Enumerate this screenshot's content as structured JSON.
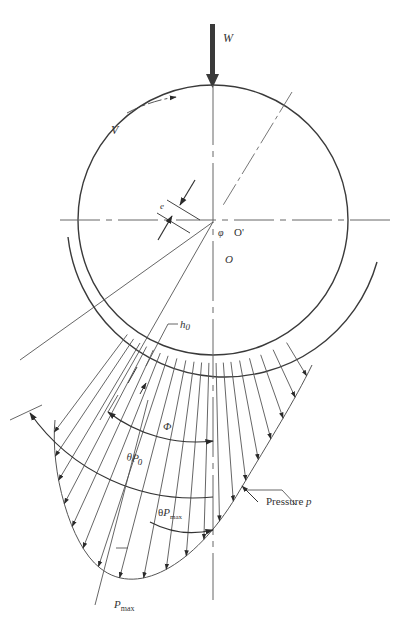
{
  "diagram": {
    "colors": {
      "line": "#3a3a3a",
      "light": "#777777",
      "text": "#333333"
    },
    "labels": {
      "load": "W",
      "velocity": "V",
      "eccentricity": "e",
      "attitude_angle": "φ",
      "journal_center": "O'",
      "bearing_center": "O",
      "min_film": "h",
      "min_film_sub": "0",
      "extent_angle": "Φ",
      "theta_p0": "θ",
      "theta_p0_p": "P",
      "theta_p0_sub": "0",
      "theta_pmax": "θ",
      "theta_pmax_p": "P",
      "theta_pmax_sub": "max",
      "pressure": "Pressure ",
      "pressure_var": "p",
      "pmax": "P",
      "pmax_sub": "max"
    }
  }
}
